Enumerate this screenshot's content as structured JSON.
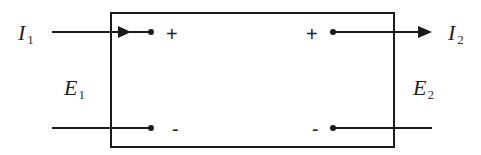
{
  "diagram": {
    "type": "two-port network",
    "port1": {
      "current_label": "I",
      "current_sub": "1",
      "voltage_label": "E",
      "voltage_sub": "1",
      "plus": "+",
      "minus": "-"
    },
    "port2": {
      "current_label": "I",
      "current_sub": "2",
      "voltage_label": "E",
      "voltage_sub": "2",
      "plus": "+",
      "minus": "-"
    },
    "colors": {
      "stroke": "#1a1a1a",
      "background": "#ffffff"
    }
  }
}
